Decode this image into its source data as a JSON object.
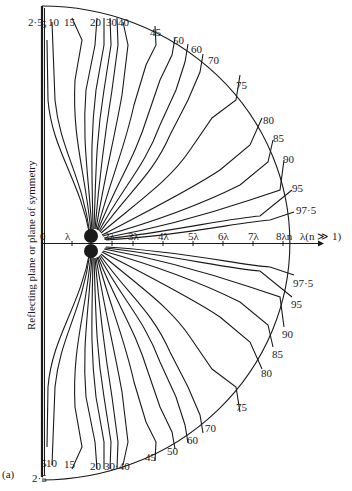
{
  "figure": {
    "panel_label": "(a)",
    "plane_label": "Reflecting plane or plane of symmetry",
    "axis": {
      "ticks": [
        "0",
        "λ",
        "2λ",
        "3λ",
        "4λ",
        "5λ",
        "6λ",
        "7λ",
        "8λn",
        "λ(n ≫ 1)"
      ]
    },
    "contour_levels_upper": [
      "2·5",
      "5",
      "10",
      "15",
      "20",
      "30",
      "40",
      "45",
      "50",
      "60",
      "70",
      "75",
      "80",
      "85",
      "90",
      "95",
      "97·5"
    ],
    "contour_levels_lower": [
      "2·5",
      "5",
      "10",
      "15",
      "20",
      "30",
      "40",
      "45",
      "50",
      "60",
      "70",
      "75",
      "80",
      "85",
      "90",
      "95",
      "97·5"
    ],
    "lower_30_40_label": "30·40"
  }
}
